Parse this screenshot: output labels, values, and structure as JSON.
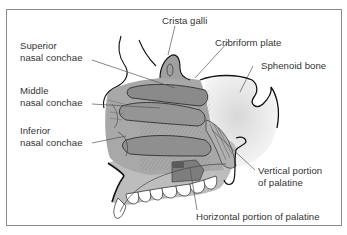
{
  "figure": {
    "labels": {
      "crista_galli": "Crista galli",
      "cribriform_plate": "Cribriform plate",
      "sphenoid_bone": "Sphenoid bone",
      "superior_line1": "Superior",
      "superior_line2": "nasal conchae",
      "middle_line1": "Middle",
      "middle_line2": "nasal conchae",
      "inferior_line1": "Inferior",
      "inferior_line2": "nasal conchae",
      "vertical_line1": "Vertical portion",
      "vertical_line2": "of palatine",
      "horizontal": "Horizontal portion of palatine"
    },
    "colors": {
      "frame_border": "#8a8a8a",
      "bone_fill": "#bdbdbd",
      "concha_fill": "#8e8e8e",
      "sphenoid_fill": "#e6e6e6",
      "outline": "#111111",
      "leader_line": "#555555",
      "text": "#333333"
    }
  }
}
